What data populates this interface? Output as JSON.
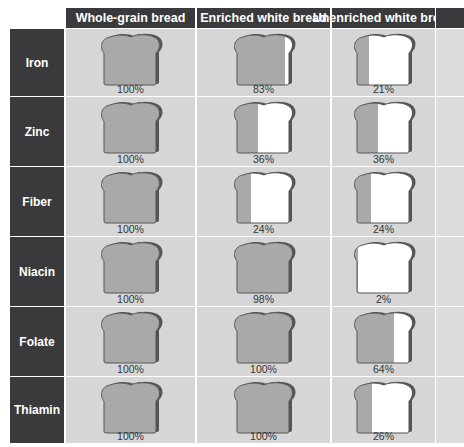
{
  "columns": [
    {
      "label": "Whole-grain bread"
    },
    {
      "label": "Enriched white bread"
    },
    {
      "label": "Unenriched white bread"
    }
  ],
  "rows": [
    {
      "nutrient": "Iron",
      "values": [
        100,
        83,
        21
      ],
      "labels": [
        "100%",
        "83%",
        "21%"
      ]
    },
    {
      "nutrient": "Zinc",
      "values": [
        100,
        36,
        36
      ],
      "labels": [
        "100%",
        "36%",
        "36%"
      ]
    },
    {
      "nutrient": "Fiber",
      "values": [
        100,
        24,
        24
      ],
      "labels": [
        "100%",
        "24%",
        "24%"
      ]
    },
    {
      "nutrient": "Niacin",
      "values": [
        100,
        98,
        2
      ],
      "labels": [
        "100%",
        "98%",
        "2%"
      ]
    },
    {
      "nutrient": "Folate",
      "values": [
        100,
        100,
        64
      ],
      "labels": [
        "100%",
        "100%",
        "64%"
      ]
    },
    {
      "nutrient": "Thiamin",
      "values": [
        100,
        100,
        26
      ],
      "labels": [
        "100%",
        "100%",
        "26%"
      ]
    }
  ],
  "colors": {
    "header_bg": "#3a3a3c",
    "cell_bg": "#d6d6d6",
    "bread_fill": "#a9a9a9",
    "bread_empty": "#ffffff",
    "bread_crust": "#555555"
  },
  "chart_data": {
    "type": "table",
    "title": "",
    "categories": [
      "Iron",
      "Zinc",
      "Fiber",
      "Niacin",
      "Folate",
      "Thiamin"
    ],
    "series": [
      {
        "name": "Whole-grain bread",
        "values": [
          100,
          100,
          100,
          100,
          100,
          100
        ]
      },
      {
        "name": "Enriched white bread",
        "values": [
          83,
          36,
          24,
          98,
          100,
          100
        ]
      },
      {
        "name": "Unenriched white bread",
        "values": [
          21,
          36,
          24,
          2,
          64,
          26
        ]
      }
    ],
    "unit": "%"
  }
}
